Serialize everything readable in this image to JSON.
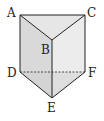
{
  "diagram": {
    "type": "triangular-prism",
    "colors": {
      "stroke": "#222222",
      "top_face": "#e6e6e6",
      "left_face": "#d9d9d9",
      "right_face": "#ececec",
      "bottom_face": "#d4d4d4"
    },
    "vertices": {
      "A": {
        "label": "A",
        "x": 20,
        "y": 15,
        "lx": 9,
        "ly": 16
      },
      "B": {
        "label": "B",
        "x": 52,
        "y": 40,
        "lx": 42,
        "ly": 55
      },
      "C": {
        "label": "C",
        "x": 85,
        "y": 15,
        "lx": 89,
        "ly": 16
      },
      "D": {
        "label": "D",
        "x": 20,
        "y": 72,
        "lx": 8,
        "ly": 77
      },
      "E": {
        "label": "E",
        "x": 52,
        "y": 98,
        "lx": 48,
        "ly": 112
      },
      "F": {
        "label": "F",
        "x": 85,
        "y": 72,
        "lx": 88,
        "ly": 78
      }
    },
    "hidden_edges": [
      "DF"
    ]
  }
}
